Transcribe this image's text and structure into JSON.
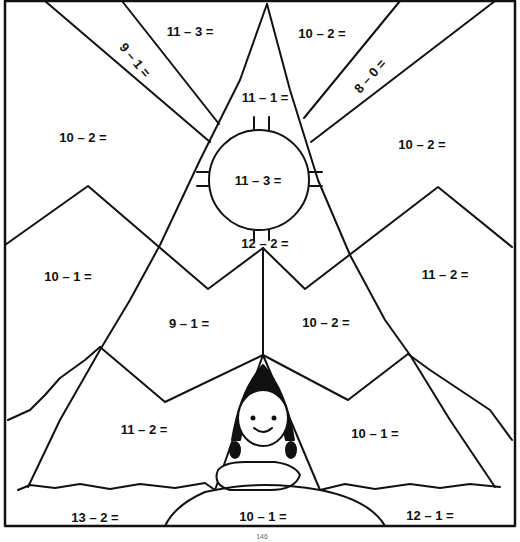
{
  "worksheet": {
    "title": "Subtraction color-by-number: girl in teepee",
    "page_number": "146",
    "stroke_color": "#111111",
    "background": "#ffffff"
  },
  "regions": [
    {
      "id": "sky-top-left-ray",
      "text": "11 – 3 =",
      "x": 190,
      "y": 31,
      "rotate": 0
    },
    {
      "id": "sky-diagonal-left",
      "text": "9 – 1 =",
      "x": 135,
      "y": 60,
      "rotate": 50
    },
    {
      "id": "sky-top-right-ray",
      "text": "10 – 2 =",
      "x": 322,
      "y": 33,
      "rotate": 0
    },
    {
      "id": "sky-diagonal-right",
      "text": "8 – 0 =",
      "x": 370,
      "y": 76,
      "rotate": -48
    },
    {
      "id": "teepee-top",
      "text": "11 – 1 =",
      "x": 265,
      "y": 97,
      "rotate": 0
    },
    {
      "id": "sky-left",
      "text": "10 – 2 =",
      "x": 83,
      "y": 137,
      "rotate": 0
    },
    {
      "id": "sky-right",
      "text": "10 – 2 =",
      "x": 422,
      "y": 144,
      "rotate": 0
    },
    {
      "id": "teepee-circle",
      "text": "11 – 3 =",
      "x": 258,
      "y": 180,
      "rotate": 0
    },
    {
      "id": "teepee-middle",
      "text": "12 – 2 =",
      "x": 265,
      "y": 243,
      "rotate": 0
    },
    {
      "id": "mountain-left",
      "text": "10 – 1 =",
      "x": 68,
      "y": 276,
      "rotate": 0
    },
    {
      "id": "mountain-right",
      "text": "11 – 2 =",
      "x": 445,
      "y": 274,
      "rotate": 0
    },
    {
      "id": "teepee-lower-left",
      "text": "9 – 1 =",
      "x": 189,
      "y": 323,
      "rotate": 0
    },
    {
      "id": "teepee-lower-right",
      "text": "10 – 2 =",
      "x": 326,
      "y": 322,
      "rotate": 0
    },
    {
      "id": "tent-left",
      "text": "11 – 2 =",
      "x": 144,
      "y": 429,
      "rotate": 0
    },
    {
      "id": "tent-right",
      "text": "10 – 1 =",
      "x": 375,
      "y": 433,
      "rotate": 0
    },
    {
      "id": "grass-left",
      "text": "13 – 2 =",
      "x": 95,
      "y": 517,
      "rotate": 0
    },
    {
      "id": "grass-middle",
      "text": "10 – 1 =",
      "x": 263,
      "y": 516,
      "rotate": 0
    },
    {
      "id": "grass-right",
      "text": "12 – 1 =",
      "x": 430,
      "y": 515,
      "rotate": 0
    }
  ]
}
